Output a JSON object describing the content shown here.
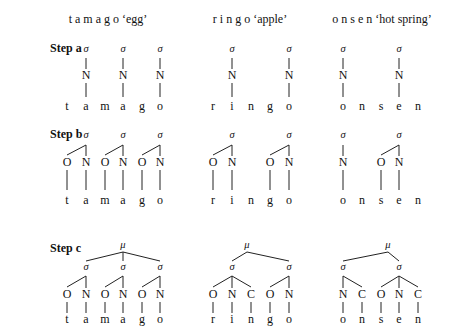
{
  "headers": [
    {
      "text": "t a m a g o ‘egg’",
      "x": 108
    },
    {
      "text": "r i n g o ‘apple’",
      "x": 250
    },
    {
      "text": "o n s e n ‘hot spring’",
      "x": 382
    }
  ],
  "steps": [
    {
      "label": "Step a",
      "y": 52
    },
    {
      "label": "Step b",
      "y": 138
    },
    {
      "label": "Step c",
      "y": 252
    }
  ],
  "symbols": {
    "syllable": "σ",
    "mora_foot": "μ",
    "onset": "O",
    "nucleus": "N",
    "coda": "C"
  },
  "words": [
    {
      "word": "tamago",
      "gloss": "egg",
      "segments": [
        {
          "s": "t",
          "x": 67
        },
        {
          "s": "a",
          "x": 86
        },
        {
          "s": "m",
          "x": 105
        },
        {
          "s": "a",
          "x": 123
        },
        {
          "s": "g",
          "x": 142
        },
        {
          "s": "o",
          "x": 160
        }
      ],
      "step_a": [
        {
          "n": 1
        },
        {
          "n": 3
        },
        {
          "n": 5
        }
      ],
      "step_b": [
        {
          "o": 0,
          "n": 1
        },
        {
          "o": 2,
          "n": 3
        },
        {
          "o": 4,
          "n": 5
        }
      ],
      "step_c": {
        "mu_x": 123,
        "syll": [
          {
            "o": 0,
            "n": 1
          },
          {
            "o": 2,
            "n": 3
          },
          {
            "o": 4,
            "n": 5
          }
        ]
      }
    },
    {
      "word": "ringo",
      "gloss": "apple",
      "segments": [
        {
          "s": "r",
          "x": 213
        },
        {
          "s": "i",
          "x": 232
        },
        {
          "s": "n",
          "x": 251
        },
        {
          "s": "g",
          "x": 270
        },
        {
          "s": "o",
          "x": 289
        }
      ],
      "step_a": [
        {
          "n": 1
        },
        {
          "n": 4
        }
      ],
      "step_b": [
        {
          "o": 0,
          "n": 1
        },
        {
          "o": 3,
          "n": 4
        }
      ],
      "step_c": {
        "mu_x": 247,
        "syll": [
          {
            "o": 0,
            "n": 1,
            "c": 2
          },
          {
            "o": 3,
            "n": 4
          }
        ]
      }
    },
    {
      "word": "onsen",
      "gloss": "hot spring",
      "segments": [
        {
          "s": "o",
          "x": 343
        },
        {
          "s": "n",
          "x": 362
        },
        {
          "s": "s",
          "x": 381
        },
        {
          "s": "e",
          "x": 399
        },
        {
          "s": "n",
          "x": 418
        }
      ],
      "step_a": [
        {
          "n": 0
        },
        {
          "n": 3
        }
      ],
      "step_b": [
        {
          "n": 0
        },
        {
          "o": 2,
          "n": 3
        }
      ],
      "step_c": {
        "mu_x": 388,
        "syll": [
          {
            "n": 0,
            "c": 1
          },
          {
            "o": 2,
            "n": 3,
            "c": 4
          }
        ]
      }
    }
  ]
}
